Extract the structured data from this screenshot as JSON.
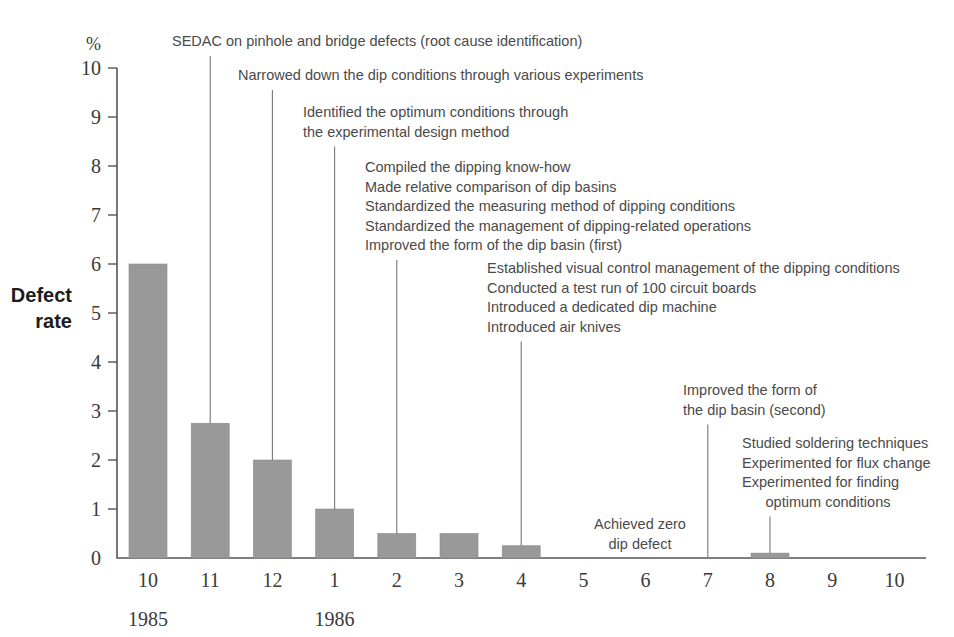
{
  "chart_data": {
    "type": "bar",
    "title": "",
    "subtitle": "",
    "unit_label": "%",
    "ylabel": "Defect rate",
    "ylabel_lines": [
      "Defect",
      "rate"
    ],
    "xlabel": "",
    "ylim": [
      0,
      10
    ],
    "ytick_labels": [
      "0",
      "1",
      "2",
      "3",
      "4",
      "5",
      "6",
      "7",
      "8",
      "9",
      "10"
    ],
    "ytick_values": [
      0,
      1,
      2,
      3,
      4,
      5,
      6,
      7,
      8,
      9,
      10
    ],
    "grid": false,
    "legend": "none",
    "categories": [
      "10",
      "11",
      "12",
      "1",
      "2",
      "3",
      "4",
      "5",
      "6",
      "7",
      "8",
      "9",
      "10"
    ],
    "values": [
      6.0,
      2.75,
      2.0,
      1.0,
      0.5,
      0.5,
      0.25,
      0,
      0,
      0,
      0.1,
      0,
      0
    ],
    "bar_color": "#999999",
    "axis_color": "#555555",
    "text_color": "#4a4a4a",
    "period_labels": [
      {
        "text": "1985",
        "category": "10"
      },
      {
        "text": "1986",
        "category": "1"
      }
    ],
    "annotations": [
      {
        "id": "annotation-sedac",
        "lines": [
          "SEDAC on pinhole and bridge defects (root cause identification)"
        ],
        "target_category": "11",
        "target_value": 2.75
      },
      {
        "id": "annotation-narrowed-dip-conditions",
        "lines": [
          "Narrowed down the dip conditions through various experiments"
        ],
        "target_category": "12",
        "target_value": 2.0
      },
      {
        "id": "annotation-optimum-conditions",
        "lines": [
          "Identified the optimum conditions through",
          "the experimental design method"
        ],
        "target_category": "1",
        "target_value": 1.0
      },
      {
        "id": "annotation-dipping-know-how",
        "lines": [
          "Compiled the dipping know-how",
          "Made relative comparison of dip basins",
          "Standardized the measuring method of dipping conditions",
          "Standardized the management of dipping-related operations",
          "Improved the form of the dip basin (first)"
        ],
        "target_category": "2",
        "target_value": 0.5
      },
      {
        "id": "annotation-visual-control",
        "lines": [
          "Established visual control management of the dipping conditions",
          "Conducted a test run of 100 circuit boards",
          "Introduced a dedicated dip machine",
          "Introduced air knives"
        ],
        "target_category": "4",
        "target_value": 0.25
      },
      {
        "id": "annotation-achieved-zero",
        "lines": [
          "Achieved zero",
          "dip defect"
        ],
        "target_category": "5",
        "target_value": null
      },
      {
        "id": "annotation-dip-basin-second",
        "lines": [
          "Improved the form of",
          "the dip basin (second)"
        ],
        "target_category": "7",
        "target_value": 0
      },
      {
        "id": "annotation-soldering-techniques",
        "lines": [
          "Studied soldering techniques",
          "Experimented for flux change",
          "Experimented for finding",
          "optimum conditions"
        ],
        "target_category": "8",
        "target_value": 0.1
      }
    ]
  }
}
